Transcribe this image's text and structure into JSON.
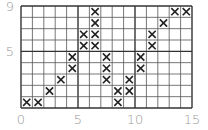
{
  "chart_data": {
    "type": "scatter",
    "title": "",
    "xlabel": "",
    "ylabel": "",
    "marker": "x",
    "grid": true,
    "xlim": [
      0,
      15
    ],
    "ylim": [
      0,
      9
    ],
    "x_ticks": [
      0,
      5,
      10,
      15
    ],
    "y_ticks": [
      5,
      9
    ],
    "x_tick_labels": [
      "0",
      "5",
      "10",
      "15"
    ],
    "y_tick_labels": [
      "5",
      "9"
    ],
    "cells": [
      {
        "col": 1,
        "row": 1
      },
      {
        "col": 2,
        "row": 1
      },
      {
        "col": 3,
        "row": 2
      },
      {
        "col": 4,
        "row": 3
      },
      {
        "col": 5,
        "row": 4
      },
      {
        "col": 5,
        "row": 5
      },
      {
        "col": 6,
        "row": 6
      },
      {
        "col": 6,
        "row": 7
      },
      {
        "col": 7,
        "row": 6
      },
      {
        "col": 7,
        "row": 7
      },
      {
        "col": 7,
        "row": 8
      },
      {
        "col": 7,
        "row": 9
      },
      {
        "col": 8,
        "row": 3
      },
      {
        "col": 8,
        "row": 4
      },
      {
        "col": 8,
        "row": 5
      },
      {
        "col": 9,
        "row": 1
      },
      {
        "col": 9,
        "row": 2
      },
      {
        "col": 10,
        "row": 2
      },
      {
        "col": 10,
        "row": 3
      },
      {
        "col": 11,
        "row": 4
      },
      {
        "col": 11,
        "row": 5
      },
      {
        "col": 12,
        "row": 6
      },
      {
        "col": 12,
        "row": 7
      },
      {
        "col": 13,
        "row": 8
      },
      {
        "col": 14,
        "row": 9
      },
      {
        "col": 15,
        "row": 9
      }
    ],
    "column_heights": [
      1,
      1,
      2,
      3,
      5,
      7,
      9,
      5,
      2,
      3,
      5,
      7,
      8,
      9,
      9
    ]
  },
  "colors": {
    "grid": "#555555",
    "grid_major": "#333333",
    "marker": "#222222",
    "tick_label": "#9a9a9a"
  }
}
